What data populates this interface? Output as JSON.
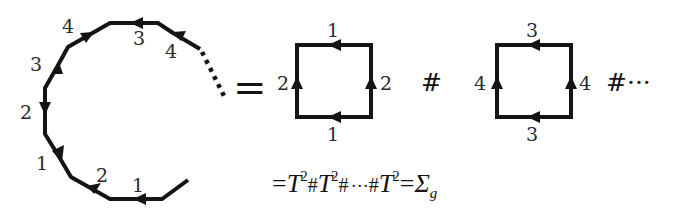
{
  "diagram": {
    "polygon": {
      "edge_labels": [
        "1",
        "2",
        "1",
        "2",
        "3",
        "4",
        "3",
        "4"
      ],
      "continuation": "dotted"
    },
    "equals_sign": "=",
    "connect_sum_symbol": "#",
    "trailing_ellipsis": "#···",
    "squares": [
      {
        "top_label": "1",
        "bottom_label": "1",
        "left_label": "2",
        "right_label": "2"
      },
      {
        "top_label": "3",
        "bottom_label": "3",
        "left_label": "4",
        "right_label": "4"
      }
    ],
    "formula": {
      "prefix": "=",
      "term": "T",
      "exponent": "2",
      "hash": "#",
      "dots": "···",
      "equals": "=",
      "result": "Σ",
      "result_subscript": "g"
    }
  }
}
